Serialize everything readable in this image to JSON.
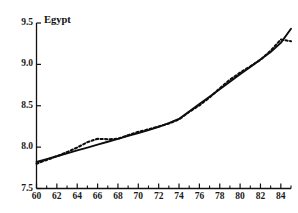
{
  "chart_data": {
    "type": "line",
    "title": "Egypt",
    "xlabel": "",
    "ylabel": "",
    "xlim": [
      60,
      85
    ],
    "ylim": [
      7.5,
      9.5
    ],
    "grid": false,
    "legend": "none",
    "x_tick_labels": [
      "60",
      "62",
      "64",
      "66",
      "68",
      "70",
      "72",
      "74",
      "76",
      "78",
      "80",
      "82",
      "84"
    ],
    "x_tick_values": [
      60,
      62,
      64,
      66,
      68,
      70,
      72,
      74,
      76,
      78,
      80,
      82,
      84
    ],
    "x_minor_ticks": [
      61,
      63,
      65,
      67,
      69,
      71,
      73,
      75,
      77,
      79,
      81,
      83,
      85
    ],
    "y_tick_labels": [
      "7.5",
      "8.0",
      "8.5",
      "9.0",
      "9.5"
    ],
    "y_tick_values": [
      7.5,
      8.0,
      8.5,
      9.0,
      9.5
    ],
    "x": [
      60,
      61,
      62,
      63,
      64,
      65,
      66,
      67,
      68,
      69,
      70,
      71,
      72,
      73,
      74,
      75,
      76,
      77,
      78,
      79,
      80,
      81,
      82,
      83,
      84,
      85
    ],
    "series": [
      {
        "name": "fitted",
        "style": "solid",
        "values": [
          7.82,
          7.855,
          7.89,
          7.925,
          7.96,
          7.995,
          8.03,
          8.065,
          8.1,
          8.135,
          8.17,
          8.205,
          8.245,
          8.29,
          8.34,
          8.43,
          8.52,
          8.61,
          8.7,
          8.79,
          8.88,
          8.97,
          9.06,
          9.15,
          9.26,
          9.43
        ]
      },
      {
        "name": "observed",
        "style": "dotted",
        "values": [
          7.8,
          7.845,
          7.89,
          7.94,
          7.995,
          8.06,
          8.1,
          8.095,
          8.1,
          8.145,
          8.185,
          8.215,
          8.25,
          8.285,
          8.335,
          8.425,
          8.505,
          8.6,
          8.71,
          8.815,
          8.9,
          8.975,
          9.055,
          9.165,
          9.3,
          9.28
        ]
      }
    ]
  }
}
